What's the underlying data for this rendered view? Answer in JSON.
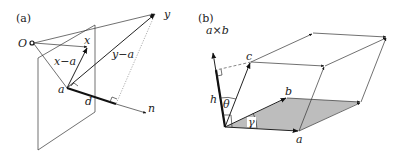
{
  "figure": {
    "panels": [
      {
        "id": "a",
        "label": "(a)",
        "labels": {
          "origin": "O",
          "x": "x",
          "y": "y",
          "x_minus_a": "x−a",
          "y_minus_a": "y−a",
          "a": "a",
          "d": "d",
          "n": "n"
        },
        "description": "Plane through point a with normal n; distance d from y to plane"
      },
      {
        "id": "b",
        "label": "(b)",
        "labels": {
          "a_cross_b": "a×b",
          "a": "a",
          "b": "b",
          "c": "c",
          "h": "h",
          "theta": "θ",
          "gamma": "γ"
        },
        "description": "Parallelepiped spanned by a, b, c; base parallelogram shaded; height h along a×b"
      }
    ],
    "colors": {
      "ink": "#222222",
      "shade": "#bdbdbd",
      "background": "#ffffff"
    }
  }
}
